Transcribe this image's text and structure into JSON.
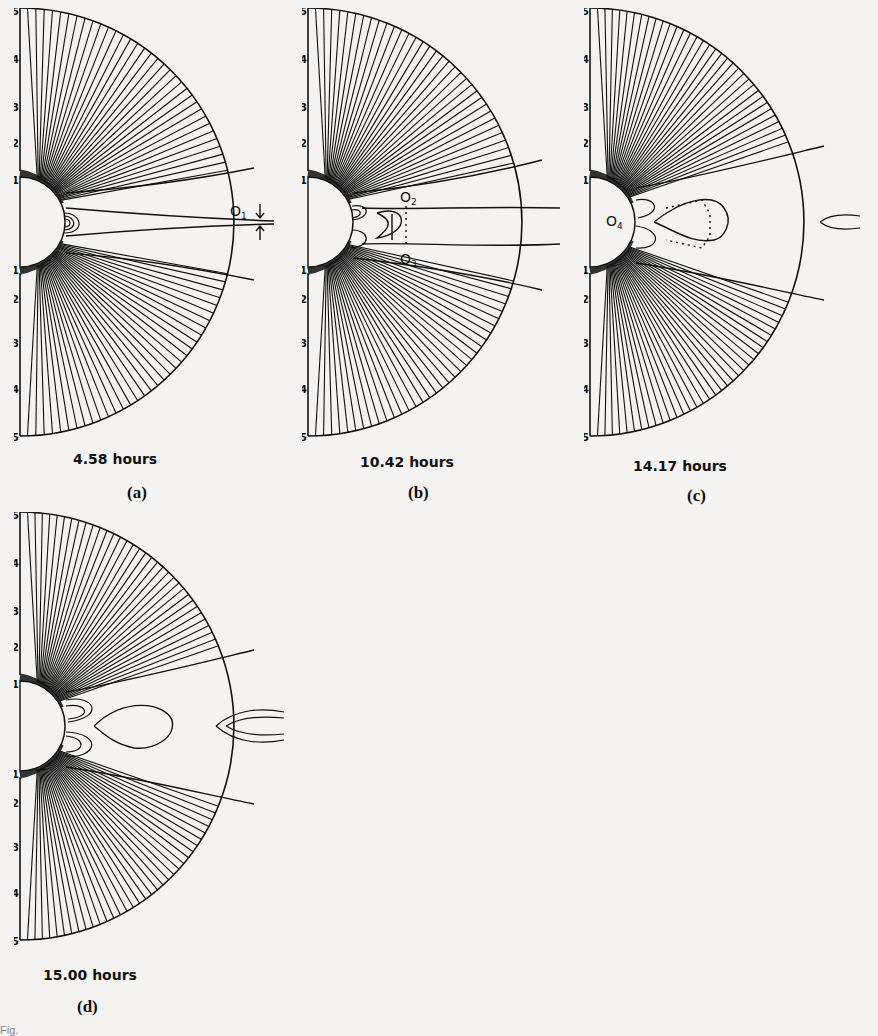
{
  "figure": {
    "panels": [
      {
        "id": "a",
        "letter": "(a)",
        "time": "4.58 hours",
        "markers": [
          "O1"
        ]
      },
      {
        "id": "b",
        "letter": "(b)",
        "time": "10.42 hours",
        "markers": [
          "O2",
          "O3"
        ]
      },
      {
        "id": "c",
        "letter": "(c)",
        "time": "14.17 hours",
        "markers": [
          "O4"
        ]
      },
      {
        "id": "d",
        "letter": "(d)",
        "time": "15.00 hours",
        "markers": []
      }
    ],
    "axis_ticks": [
      "5",
      "4",
      "3",
      "2",
      "1",
      "1",
      "2",
      "3",
      "4",
      "5"
    ],
    "marker_labels": {
      "O1": "O",
      "O1_sub": "1",
      "O2": "O",
      "O2_sub": "2",
      "O3": "O",
      "O3_sub": "3",
      "O4": "O",
      "O4_sub": "4"
    },
    "caption_fragment": "Fig."
  },
  "colors": {
    "ink": "#111111",
    "paper": "#f4f3f1"
  }
}
